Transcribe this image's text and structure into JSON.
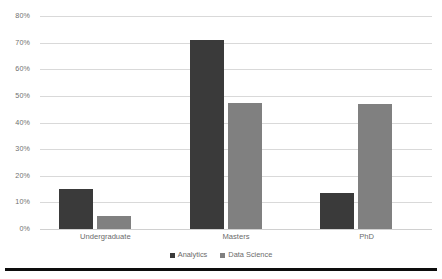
{
  "chart_data": {
    "type": "bar",
    "title": "",
    "subtitle": "",
    "xlabel": "",
    "ylabel": "",
    "categories": [
      "Undergraduate",
      "Masters",
      "PhD"
    ],
    "series": [
      {
        "name": "Analytics",
        "color": "#3a3a3a",
        "values": [
          15,
          71,
          13.5
        ]
      },
      {
        "name": "Data Science",
        "color": "#808080",
        "values": [
          5,
          47.5,
          47
        ]
      }
    ],
    "ylim": [
      0,
      80
    ],
    "ytick_step": 10,
    "ytick_labels": [
      "0%",
      "10%",
      "20%",
      "30%",
      "40%",
      "50%",
      "60%",
      "70%",
      "80%"
    ],
    "ytick_values": [
      0,
      10,
      20,
      30,
      40,
      50,
      60,
      70,
      80
    ],
    "value_suffix": "%",
    "grid": true,
    "grid_axis": "y",
    "grid_color": "#d9d9d9",
    "legend_position": "bottom",
    "background": "#ffffff",
    "axis_label_color": "#6b6b6b",
    "bottom_rule_color": "#0d0d0d"
  }
}
